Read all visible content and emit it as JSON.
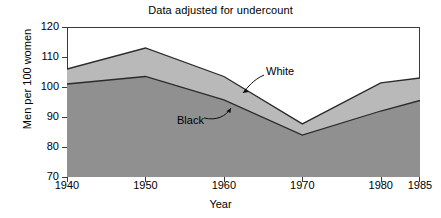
{
  "chart_data": {
    "type": "area",
    "title": "Data adjusted for undercount",
    "xlabel": "Year",
    "ylabel": "Men per 100 women",
    "x": [
      1940,
      1950,
      1960,
      1970,
      1980,
      1985
    ],
    "xticklabels": [
      "1940",
      "1950",
      "1960",
      "1970",
      "1980",
      "1985"
    ],
    "xlim": [
      1940,
      1985
    ],
    "ylim": [
      70,
      120
    ],
    "yticks": [
      70,
      80,
      90,
      100,
      110,
      120
    ],
    "yticklabels": [
      "70",
      "80",
      "90",
      "100",
      "110",
      "120"
    ],
    "grid": false,
    "legend": "annotations-on-plot",
    "stacked": false,
    "series": [
      {
        "name": "White",
        "values": [
          106.0,
          113.0,
          103.5,
          87.7,
          101.4,
          103.0
        ],
        "fill_color": "#b9b9b9",
        "line_color": "#2b2b2b",
        "annotation": "White"
      },
      {
        "name": "Black",
        "values": [
          101.0,
          103.5,
          95.7,
          84.0,
          92.0,
          95.5
        ],
        "fill_color": "#909090",
        "line_color": "#2b2b2b",
        "annotation": "Black"
      }
    ]
  },
  "annotations": {
    "white_label": "White",
    "black_label": "Black"
  },
  "axes": {
    "frame_color": "#3a3a3a",
    "background": "#ffffff"
  }
}
